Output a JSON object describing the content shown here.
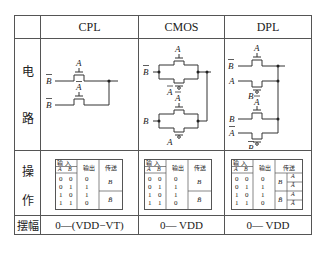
{
  "columns": [
    "CPL",
    "CMOS",
    "DPL"
  ],
  "rows": {
    "circuit": {
      "label_top": "电",
      "label_bottom": "路"
    },
    "operation": {
      "label_top": "操",
      "label_bottom": "作"
    },
    "swing": {
      "label": "摆幅"
    }
  },
  "circuits": {
    "CPL": {
      "inputs": [
        "B̄",
        "B̄"
      ],
      "gates": [
        "A",
        "Ā"
      ]
    },
    "CMOS": {
      "inputs": [
        "B̄",
        "B"
      ],
      "gates_top": [
        "A",
        "Ā"
      ],
      "gates_bottom": [
        "Ā",
        "A"
      ]
    },
    "DPL": {
      "inputs": [
        "B̄",
        "A",
        "B",
        "Ā"
      ],
      "gates": [
        "A",
        "B",
        "Ā",
        "B̄"
      ]
    }
  },
  "truth_table": {
    "header_input": "输 入",
    "header_output": "输出",
    "header_pass": "传送",
    "sub_a": "A",
    "sub_b": "B",
    "rows": [
      {
        "a": "0",
        "b": "0",
        "out": "0"
      },
      {
        "a": "0",
        "b": "1",
        "out": "1"
      },
      {
        "a": "1",
        "b": "0",
        "out": "1"
      },
      {
        "a": "1",
        "b": "1",
        "out": "0"
      }
    ],
    "pass_cpl": [
      "B",
      "B̄"
    ],
    "pass_cmos": [
      "B",
      "B̄"
    ],
    "pass_dpl": [
      "B",
      "B̄"
    ],
    "pass_dpl_sub": [
      "A",
      "Ā",
      "A",
      "Ā"
    ]
  },
  "swing": {
    "CPL": "0—(VDD−VT)",
    "CMOS": "0— VDD",
    "DPL": "0— VDD"
  }
}
